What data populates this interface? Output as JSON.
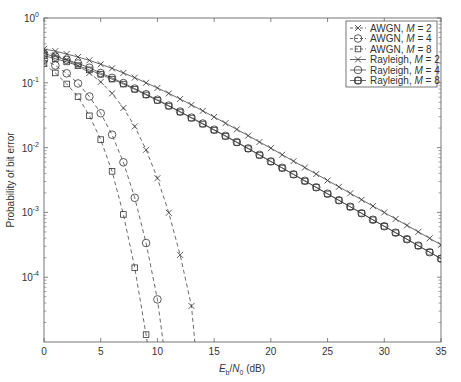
{
  "chart_data": {
    "type": "line",
    "title": "",
    "xlabel": "E_b/N_0 (dB)",
    "xlabel_parts": {
      "E": "E",
      "b": "b",
      "slash": "/",
      "N": "N",
      "zero": "0",
      "unit": " (dB)"
    },
    "ylabel": "Probability of bit error",
    "xlim": [
      0,
      35
    ],
    "ylim": [
      1e-05,
      1
    ],
    "yscale": "log",
    "grid": false,
    "legend_position": "upper right",
    "x_ticks": [
      0,
      5,
      10,
      15,
      20,
      25,
      30,
      35
    ],
    "x_tick_labels": [
      "0",
      "5",
      "10",
      "15",
      "20",
      "25",
      "30",
      "35"
    ],
    "y_ticks": [
      1,
      0.1,
      0.01,
      0.001,
      0.0001
    ],
    "y_tick_labels": [
      {
        "base": "10",
        "exp": "0"
      },
      {
        "base": "10",
        "exp": "-1"
      },
      {
        "base": "10",
        "exp": "-2"
      },
      {
        "base": "10",
        "exp": "-3"
      },
      {
        "base": "10",
        "exp": "-4"
      }
    ],
    "series": [
      {
        "name": "AWGN, M = 2",
        "label_prefix": "AWGN, ",
        "label_var": "M",
        "label_suffix": " = 2",
        "line": "dashed",
        "marker": "x",
        "x": [
          0,
          1,
          2,
          3,
          4,
          5,
          6,
          7,
          8,
          9,
          10,
          11,
          12,
          13,
          13.3
        ],
        "y": [
          0.303,
          0.267,
          0.226,
          0.184,
          0.142,
          0.103,
          0.0686,
          0.0409,
          0.0212,
          0.00925,
          0.00337,
          0.000987,
          0.000221,
          3.6e-05,
          1e-05
        ]
      },
      {
        "name": "AWGN, M = 4",
        "label_prefix": "AWGN, ",
        "label_var": "M",
        "label_suffix": " = 4",
        "line": "dashed",
        "marker": "o",
        "x": [
          0,
          1,
          2,
          3,
          4,
          5,
          6,
          7,
          8,
          9,
          10,
          10.5
        ],
        "y": [
          0.229,
          0.185,
          0.14,
          0.0977,
          0.0615,
          0.0339,
          0.0158,
          0.00593,
          0.00168,
          0.000337,
          4.54e-05,
          1e-05
        ]
      },
      {
        "name": "AWGN, M = 8",
        "label_prefix": "AWGN, ",
        "label_var": "M",
        "label_suffix": " = 8",
        "line": "dashed",
        "marker": "s",
        "x": [
          0,
          1,
          2,
          3,
          4,
          5,
          6,
          7,
          8,
          9,
          9.1
        ],
        "y": [
          0.196,
          0.142,
          0.096,
          0.061,
          0.031,
          0.0133,
          0.0043,
          0.00093,
          0.00014,
          1.3e-05,
          1e-05
        ]
      },
      {
        "name": "Rayleigh, M = 2",
        "label_prefix": "Rayleigh, ",
        "label_var": "M",
        "label_suffix": " = 2",
        "line": "solid",
        "marker": "x",
        "x": [
          0,
          1,
          2,
          3,
          4,
          5,
          6,
          7,
          8,
          9,
          10,
          11,
          12,
          13,
          14,
          15,
          16,
          17,
          18,
          19,
          20,
          21,
          22,
          23,
          24,
          25,
          26,
          27,
          28,
          29,
          30,
          31,
          32,
          33,
          34,
          35
        ],
        "y": [
          0.333,
          0.308,
          0.278,
          0.25,
          0.222,
          0.193,
          0.167,
          0.142,
          0.12,
          0.1,
          0.0833,
          0.0686,
          0.0562,
          0.0456,
          0.0369,
          0.0297,
          0.0238,
          0.0191,
          0.0153,
          0.0122,
          0.0098,
          0.00777,
          0.00618,
          0.00492,
          0.00391,
          0.00311,
          0.00248,
          0.00197,
          0.00157,
          0.00125,
          0.000998,
          0.000793,
          0.00063,
          0.000501,
          0.000398,
          0.000316
        ]
      },
      {
        "name": "Rayleigh, M = 4",
        "label_prefix": "Rayleigh, ",
        "label_var": "M",
        "label_suffix": " = 4",
        "line": "solid",
        "marker": "o",
        "x": [
          0,
          1,
          2,
          3,
          4,
          5,
          6,
          7,
          8,
          9,
          10,
          11,
          12,
          13,
          14,
          15,
          16,
          17,
          18,
          19,
          20,
          21,
          22,
          23,
          24,
          25,
          26,
          27,
          28,
          29,
          30,
          31,
          32,
          33,
          34,
          35
        ],
        "y": [
          0.281,
          0.253,
          0.226,
          0.199,
          0.171,
          0.1415,
          0.119,
          0.099,
          0.0815,
          0.0665,
          0.0548,
          0.0445,
          0.036,
          0.029,
          0.0235,
          0.0189,
          0.0152,
          0.0122,
          0.00972,
          0.00773,
          0.00612,
          0.00487,
          0.00387,
          0.00307,
          0.00244,
          0.00194,
          0.00154,
          0.00122,
          0.00097,
          0.00077,
          0.000612,
          0.000486,
          0.000386,
          0.000307,
          0.000243,
          0.000193
        ]
      },
      {
        "name": "Rayleigh, M = 8",
        "label_prefix": "Rayleigh, ",
        "label_var": "M",
        "label_suffix": " = 8",
        "line": "solid",
        "marker": "s",
        "x": [
          0,
          1,
          2,
          3,
          4,
          5,
          6,
          7,
          8,
          9,
          10,
          11,
          12,
          13,
          14,
          15,
          16,
          17,
          18,
          19,
          20,
          21,
          22,
          23,
          24,
          25,
          26,
          27,
          28,
          29,
          30,
          31,
          32,
          33,
          34,
          35
        ],
        "y": [
          0.262,
          0.236,
          0.21,
          0.184,
          0.158,
          0.135,
          0.114,
          0.0955,
          0.0793,
          0.065,
          0.0535,
          0.0437,
          0.0354,
          0.0286,
          0.0231,
          0.0186,
          0.015,
          0.012,
          0.00962,
          0.00766,
          0.00608,
          0.00484,
          0.00385,
          0.00305,
          0.00243,
          0.00193,
          0.00153,
          0.00122,
          0.000967,
          0.000768,
          0.00061,
          0.000485,
          0.000385,
          0.000306,
          0.000243,
          0.000193
        ]
      }
    ]
  }
}
